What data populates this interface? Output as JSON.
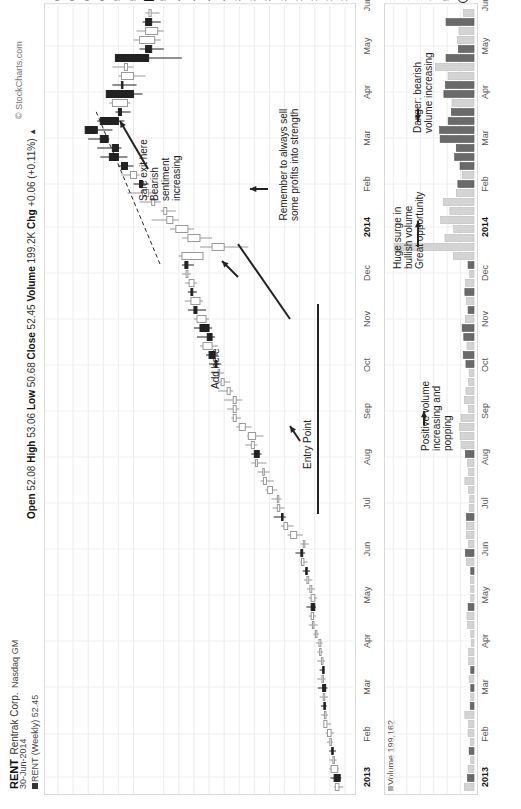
{
  "header": {
    "symbol": "RENT",
    "company": "Rentrak Corp.",
    "exchange": "Nasdaq GM",
    "date": "30-Jun-2014",
    "series_label": "RENT (Weekly) 52.45",
    "open_label": "Open",
    "open": "52.08",
    "high_label": "High",
    "high": "53.06",
    "low_label": "Low",
    "low": "50.68",
    "close_label": "Close",
    "close": "52.45",
    "volume_label": "Volume",
    "volume": "199.2K",
    "chg_label": "Chg",
    "chg": "+0.06 (+0.11%)",
    "copyright": "© StockCharts.com"
  },
  "price_axis": {
    "labels": [
      "67.5",
      "65.0",
      "62.5",
      "60.0",
      "57.5",
      "55.0",
      "52.45",
      "50.0",
      "47.5",
      "45.0",
      "42.5",
      "40.0",
      "37.5",
      "35.0",
      "32.5",
      "30.0",
      "27.5",
      "25.0",
      "22.5",
      "20.0"
    ],
    "current_tag": "52.45"
  },
  "volume_axis": {
    "labels": [
      "1.50M",
      "1.25M",
      "1.00M",
      "750K",
      "500K",
      "250K"
    ],
    "current_tag": "199162.0",
    "panel_label": "Volume 199,162"
  },
  "time_axis": {
    "labels": [
      {
        "t": "2013",
        "year": true,
        "x": 32
      },
      {
        "t": "Feb",
        "x": 75
      },
      {
        "t": "Mar",
        "x": 122
      },
      {
        "t": "Apr",
        "x": 168
      },
      {
        "t": "May",
        "x": 214
      },
      {
        "t": "Jun",
        "x": 260
      },
      {
        "t": "Jul",
        "x": 306
      },
      {
        "t": "Aug",
        "x": 352
      },
      {
        "t": "Sep",
        "x": 398
      },
      {
        "t": "Oct",
        "x": 444
      },
      {
        "t": "Nov",
        "x": 490
      },
      {
        "t": "Dec",
        "x": 536
      },
      {
        "t": "2014",
        "year": true,
        "x": 582
      },
      {
        "t": "Feb",
        "x": 625
      },
      {
        "t": "Mar",
        "x": 671
      },
      {
        "t": "Apr",
        "x": 717
      },
      {
        "t": "May",
        "x": 763
      },
      {
        "t": "Jun",
        "x": 805
      }
    ]
  },
  "annotations": {
    "remember": "Remember to always sell\nsome profits into strength",
    "safe_exit": "Safe exit here\nBearish\nsentiment\nincreasing",
    "add_here": "Add here",
    "entry_point": "Entry Point",
    "danger": "Danger: bearish\nvolume increasing",
    "huge_surge": "Huge surge in\nbullish volume\nGreat opportunity",
    "positive_volume": "Positive volume\nincreasing and\npopping"
  },
  "chart_data": {
    "type": "candlestick",
    "xlabel": "",
    "ylabel": "Price",
    "ylim": [
      20,
      67.5
    ],
    "grid": true,
    "weeks": [
      {
        "o": 21.0,
        "h": 21.8,
        "l": 20.3,
        "c": 21.6,
        "v": 180000,
        "up": true
      },
      {
        "o": 21.8,
        "h": 22.4,
        "l": 20.6,
        "c": 20.8,
        "v": 120000,
        "up": false
      },
      {
        "o": 21.2,
        "h": 22.6,
        "l": 21.0,
        "c": 22.3,
        "v": 110000,
        "up": true
      },
      {
        "o": 22.0,
        "h": 22.6,
        "l": 21.4,
        "c": 22.0,
        "v": 60000,
        "up": true
      },
      {
        "o": 22.2,
        "h": 22.6,
        "l": 21.5,
        "c": 22.1,
        "v": 90000,
        "up": false
      },
      {
        "o": 22.4,
        "h": 23.0,
        "l": 22.0,
        "c": 22.5,
        "v": 70000,
        "up": true
      },
      {
        "o": 22.3,
        "h": 23.2,
        "l": 21.8,
        "c": 22.9,
        "v": 110000,
        "up": true
      },
      {
        "o": 23.0,
        "h": 23.6,
        "l": 22.3,
        "c": 23.5,
        "v": 100000,
        "up": true
      },
      {
        "o": 23.4,
        "h": 24.0,
        "l": 22.8,
        "c": 23.4,
        "v": 170000,
        "up": true
      },
      {
        "o": 23.5,
        "h": 24.0,
        "l": 23.0,
        "c": 23.4,
        "v": 70000,
        "up": false
      },
      {
        "o": 23.6,
        "h": 24.2,
        "l": 22.8,
        "c": 23.6,
        "v": 60000,
        "up": true
      },
      {
        "o": 23.2,
        "h": 24.5,
        "l": 22.9,
        "c": 23.7,
        "v": 60000,
        "up": false
      },
      {
        "o": 23.8,
        "h": 24.6,
        "l": 23.2,
        "c": 23.8,
        "v": 90000,
        "up": true
      },
      {
        "o": 23.7,
        "h": 24.2,
        "l": 23.5,
        "c": 23.7,
        "v": 60000,
        "up": false
      },
      {
        "o": 23.7,
        "h": 24.6,
        "l": 23.3,
        "c": 23.9,
        "v": 100000,
        "up": true
      },
      {
        "o": 24.0,
        "h": 24.6,
        "l": 23.6,
        "c": 24.2,
        "v": 100000,
        "up": true
      },
      {
        "o": 24.0,
        "h": 24.8,
        "l": 23.7,
        "c": 24.3,
        "v": 50000,
        "up": true
      },
      {
        "o": 24.7,
        "h": 25.2,
        "l": 24.3,
        "c": 24.9,
        "v": 60000,
        "up": true
      },
      {
        "o": 25.3,
        "h": 26.0,
        "l": 24.5,
        "c": 25.4,
        "v": 120000,
        "up": true
      },
      {
        "o": 25.2,
        "h": 26.0,
        "l": 24.8,
        "c": 25.6,
        "v": 130000,
        "up": true
      },
      {
        "o": 25.6,
        "h": 26.4,
        "l": 24.8,
        "c": 25.0,
        "v": 110000,
        "up": false
      },
      {
        "o": 25.0,
        "h": 26.0,
        "l": 24.6,
        "c": 25.6,
        "v": 60000,
        "up": true
      },
      {
        "o": 25.5,
        "h": 26.3,
        "l": 25.0,
        "c": 25.8,
        "v": 60000,
        "up": true
      },
      {
        "o": 26.0,
        "h": 26.8,
        "l": 25.4,
        "c": 26.3,
        "v": 70000,
        "up": true
      },
      {
        "o": 26.5,
        "h": 27.0,
        "l": 25.8,
        "c": 26.3,
        "v": 60000,
        "up": false
      },
      {
        "o": 26.8,
        "h": 27.4,
        "l": 26.2,
        "c": 27.2,
        "v": 140000,
        "up": true
      },
      {
        "o": 27.3,
        "h": 28.2,
        "l": 26.6,
        "c": 27.0,
        "v": 160000,
        "up": false
      },
      {
        "o": 26.8,
        "h": 27.4,
        "l": 26.0,
        "c": 26.9,
        "v": 100000,
        "up": true
      },
      {
        "o": 28.0,
        "h": 29.5,
        "l": 27.0,
        "c": 29.0,
        "v": 140000,
        "up": true
      },
      {
        "o": 29.5,
        "h": 30.6,
        "l": 28.5,
        "c": 30.1,
        "v": 140000,
        "up": true
      },
      {
        "o": 30.5,
        "h": 31.8,
        "l": 29.8,
        "c": 30.5,
        "v": 140000,
        "up": false
      },
      {
        "o": 30.8,
        "h": 32.0,
        "l": 30.0,
        "c": 31.2,
        "v": 90000,
        "up": true
      },
      {
        "o": 31.2,
        "h": 32.2,
        "l": 30.5,
        "c": 31.2,
        "v": 80000,
        "up": true
      },
      {
        "o": 32.0,
        "h": 33.2,
        "l": 31.2,
        "c": 32.8,
        "v": 100000,
        "up": true
      },
      {
        "o": 33.0,
        "h": 34.0,
        "l": 31.8,
        "c": 33.5,
        "v": 170000,
        "up": true
      },
      {
        "o": 33.5,
        "h": 34.5,
        "l": 32.5,
        "c": 33.6,
        "v": 100000,
        "up": true
      },
      {
        "o": 34.5,
        "h": 35.5,
        "l": 33.0,
        "c": 34.8,
        "v": 120000,
        "up": true
      },
      {
        "o": 35.0,
        "h": 35.5,
        "l": 33.8,
        "c": 34.2,
        "v": 160000,
        "up": false
      },
      {
        "o": 35.0,
        "h": 36.5,
        "l": 34.5,
        "c": 35.5,
        "v": 230000,
        "up": true
      },
      {
        "o": 34.8,
        "h": 36.2,
        "l": 33.5,
        "c": 36.0,
        "v": 260000,
        "up": true
      },
      {
        "o": 36.5,
        "h": 38.0,
        "l": 35.5,
        "c": 37.5,
        "v": 270000,
        "up": true
      },
      {
        "o": 38.0,
        "h": 38.8,
        "l": 37.2,
        "c": 38.5,
        "v": 240000,
        "up": true
      },
      {
        "o": 38.5,
        "h": 39.5,
        "l": 37.5,
        "c": 38.0,
        "v": 100000,
        "up": true
      },
      {
        "o": 38.0,
        "h": 40.0,
        "l": 37.0,
        "c": 38.5,
        "v": 180000,
        "up": true
      },
      {
        "o": 39.5,
        "h": 41.0,
        "l": 38.5,
        "c": 39.0,
        "v": 150000,
        "up": true
      },
      {
        "o": 40.0,
        "h": 41.5,
        "l": 39.0,
        "c": 40.5,
        "v": 100000,
        "up": true
      },
      {
        "o": 41.0,
        "h": 42.0,
        "l": 40.0,
        "c": 41.0,
        "v": 90000,
        "up": true
      },
      {
        "o": 41.5,
        "h": 42.5,
        "l": 40.5,
        "c": 41.2,
        "v": 150000,
        "up": false
      },
      {
        "o": 42.5,
        "h": 43.0,
        "l": 41.0,
        "c": 41.5,
        "v": 200000,
        "up": false
      },
      {
        "o": 42.0,
        "h": 44.0,
        "l": 41.0,
        "c": 43.5,
        "v": 130000,
        "up": true
      },
      {
        "o": 42.0,
        "h": 44.5,
        "l": 41.5,
        "c": 42.8,
        "v": 190000,
        "up": false
      },
      {
        "o": 44.0,
        "h": 45.0,
        "l": 42.0,
        "c": 42.5,
        "v": 220000,
        "up": false
      },
      {
        "o": 43.0,
        "h": 45.0,
        "l": 42.5,
        "c": 44.5,
        "v": 160000,
        "up": true
      },
      {
        "o": 45.0,
        "h": 46.0,
        "l": 43.0,
        "c": 44.5,
        "v": 110000,
        "up": false
      },
      {
        "o": 44.0,
        "h": 46.5,
        "l": 43.5,
        "c": 45.5,
        "v": 140000,
        "up": true
      },
      {
        "o": 45.5,
        "h": 46.0,
        "l": 44.5,
        "c": 45.2,
        "v": 170000,
        "up": false
      },
      {
        "o": 45.0,
        "h": 46.5,
        "l": 44.5,
        "c": 45.8,
        "v": 160000,
        "up": true
      },
      {
        "o": 46.0,
        "h": 47.0,
        "l": 45.5,
        "c": 46.3,
        "v": 80000,
        "up": true
      },
      {
        "o": 46.0,
        "h": 47.0,
        "l": 45.0,
        "c": 46.5,
        "v": 110000,
        "up": false
      },
      {
        "o": 47.0,
        "h": 47.5,
        "l": 43.5,
        "c": 43.5,
        "v": 380000,
        "up": true
      },
      {
        "o": 42.0,
        "h": 44.0,
        "l": 36.0,
        "c": 40.0,
        "v": 1480000,
        "up": true
      },
      {
        "o": 44.0,
        "h": 47.0,
        "l": 42.0,
        "c": 46.0,
        "v": 540000,
        "up": true
      },
      {
        "o": 46.0,
        "h": 49.0,
        "l": 45.0,
        "c": 48.0,
        "v": 380000,
        "up": true
      },
      {
        "o": 48.5,
        "h": 52.0,
        "l": 47.5,
        "c": 49.5,
        "v": 620000,
        "up": true
      },
      {
        "o": 49.5,
        "h": 50.5,
        "l": 48.0,
        "c": 50.0,
        "v": 450000,
        "up": true
      },
      {
        "o": 52.0,
        "h": 54.0,
        "l": 50.5,
        "c": 51.5,
        "v": 570000,
        "up": true
      },
      {
        "o": 52.5,
        "h": 56.0,
        "l": 51.0,
        "c": 53.5,
        "v": 330000,
        "up": true
      },
      {
        "o": 53.5,
        "h": 55.0,
        "l": 52.5,
        "c": 54.0,
        "v": 300000,
        "up": false
      },
      {
        "o": 55.5,
        "h": 57.0,
        "l": 54.0,
        "c": 54.5,
        "v": 220000,
        "up": true
      },
      {
        "o": 56.0,
        "h": 57.5,
        "l": 55.0,
        "c": 57.0,
        "v": 260000,
        "up": false
      },
      {
        "o": 59.0,
        "h": 60.5,
        "l": 56.0,
        "c": 57.5,
        "v": 360000,
        "up": false
      },
      {
        "o": 58.5,
        "h": 61.0,
        "l": 57.0,
        "c": 57.5,
        "v": 330000,
        "up": false
      },
      {
        "o": 60.5,
        "h": 62.5,
        "l": 59.0,
        "c": 59.2,
        "v": 630000,
        "up": false
      },
      {
        "o": 61.0,
        "h": 63.0,
        "l": 58.5,
        "c": 63.0,
        "v": 640000,
        "up": false
      },
      {
        "o": 57.5,
        "h": 61.0,
        "l": 56.5,
        "c": 60.5,
        "v": 480000,
        "up": false
      },
      {
        "o": 57.0,
        "h": 58.0,
        "l": 55.5,
        "c": 57.5,
        "v": 420000,
        "up": false
      },
      {
        "o": 58.5,
        "h": 59.0,
        "l": 55.5,
        "c": 56.0,
        "v": 410000,
        "up": true
      },
      {
        "o": 55.0,
        "h": 59.5,
        "l": 53.5,
        "c": 59.5,
        "v": 560000,
        "up": false
      },
      {
        "o": 57.0,
        "h": 58.5,
        "l": 54.5,
        "c": 57.0,
        "v": 530000,
        "up": false
      },
      {
        "o": 55.0,
        "h": 57.5,
        "l": 53.0,
        "c": 57.0,
        "v": 480000,
        "up": true
      },
      {
        "o": 56.0,
        "h": 58.5,
        "l": 55.0,
        "c": 56.5,
        "v": 720000,
        "up": true
      },
      {
        "o": 52.5,
        "h": 58.0,
        "l": 47.0,
        "c": 58.0,
        "v": 520000,
        "up": false
      },
      {
        "o": 52.0,
        "h": 54.0,
        "l": 50.0,
        "c": 53.0,
        "v": 290000,
        "up": false
      },
      {
        "o": 51.5,
        "h": 55.0,
        "l": 50.5,
        "c": 54.0,
        "v": 310000,
        "up": true
      },
      {
        "o": 51.0,
        "h": 54.5,
        "l": 50.0,
        "c": 53.0,
        "v": 280000,
        "up": true
      },
      {
        "o": 53.0,
        "h": 53.5,
        "l": 50.5,
        "c": 52.0,
        "v": 520000,
        "up": false
      },
      {
        "o": 52.08,
        "h": 53.06,
        "l": 50.68,
        "c": 52.45,
        "v": 199162,
        "up": true
      }
    ]
  }
}
